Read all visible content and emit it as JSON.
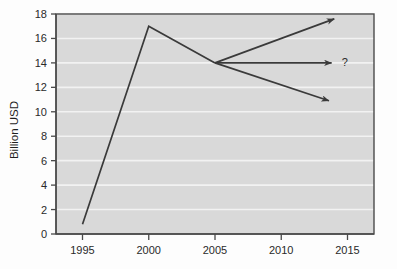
{
  "chart_data": {
    "type": "line",
    "title": "",
    "xlabel": "",
    "ylabel": "Billion USD",
    "xlim": [
      1993.0,
      2017.0
    ],
    "ylim": [
      0,
      18
    ],
    "yticks": [
      0,
      2,
      4,
      6,
      8,
      10,
      12,
      14,
      16,
      18
    ],
    "xticks": [
      1995,
      2000,
      2005,
      2010,
      2015
    ],
    "ytick_labels": [
      "0",
      "2",
      "4",
      "6",
      "8",
      "10",
      "12",
      "14",
      "16",
      "18"
    ],
    "xtick_labels": [
      "1995",
      "2000",
      "2005",
      "2010",
      "2015"
    ],
    "grid": "horizontal",
    "legend": "none",
    "series": [
      {
        "name": "historical",
        "style": "solid-line",
        "x": [
          1995,
          2000,
          2005
        ],
        "values": [
          0.8,
          17.0,
          14.0
        ]
      },
      {
        "name": "optimistic-projection",
        "style": "arrow",
        "x": [
          2005,
          2014
        ],
        "values": [
          14.0,
          17.6
        ]
      },
      {
        "name": "flat-projection",
        "style": "arrow",
        "x": [
          2005,
          2013.8
        ],
        "values": [
          14.0,
          14.0
        ]
      },
      {
        "name": "pessimistic-projection",
        "style": "arrow",
        "x": [
          2005,
          2013.6
        ],
        "values": [
          14.0,
          10.9
        ]
      }
    ],
    "annotations": [
      {
        "text": "?",
        "x": 2014.8,
        "y": 14.1
      }
    ]
  },
  "colors": {
    "plot_background": "#d9d9d9",
    "page_background": "#fdfdfd",
    "gridline": "#f2f2f2",
    "axis": "#4a4a4a",
    "line": "#3a3a3a",
    "text": "#2a2a2a"
  }
}
